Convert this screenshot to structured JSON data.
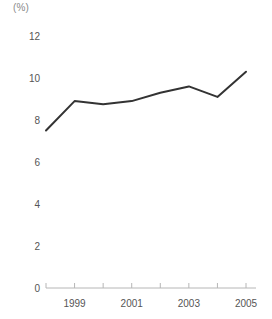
{
  "chart_data": {
    "type": "line",
    "title": "",
    "subtitle": "",
    "xlabel": "",
    "ylabel": "",
    "unit_label": "(%)",
    "grid": false,
    "legend": null,
    "x": [
      1998,
      1999,
      2000,
      2001,
      2002,
      2003,
      2004,
      2005
    ],
    "x_tick_labels": [
      "",
      "1999",
      "",
      "2001",
      "",
      "2003",
      "",
      "2005"
    ],
    "values": [
      7.5,
      8.9,
      8.75,
      8.9,
      9.3,
      9.6,
      9.1,
      10.3
    ],
    "series": [
      {
        "name": "",
        "values": [
          7.5,
          8.9,
          8.75,
          8.9,
          9.3,
          9.6,
          9.1,
          10.3
        ]
      }
    ],
    "ylim": [
      0,
      12
    ],
    "y_ticks": [
      0,
      2,
      4,
      6,
      8,
      10,
      12
    ],
    "y_tick_labels": [
      "0",
      "2",
      "4",
      "6",
      "8",
      "10",
      "12"
    ],
    "xlim": [
      1998,
      2005
    ],
    "line_color": "#333333",
    "axis_color": "#b6b6b6",
    "text_color": "#555555"
  }
}
